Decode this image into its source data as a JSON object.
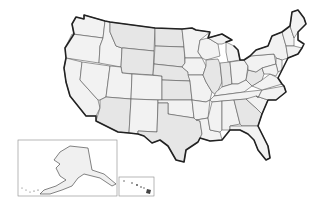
{
  "map": {
    "title": "",
    "subject": "Blank outline map of the United States",
    "features": {
      "contiguous_states": "48 state outlines with internal borders, no labels",
      "insets": [
        {
          "name": "alaska-inset",
          "description": "Alaska in a framed inset at lower left"
        },
        {
          "name": "hawaii-inset",
          "description": "Hawaiian Islands in a small framed inset right of Alaska"
        }
      ],
      "labels": []
    },
    "colors": {
      "land_fill": "#f2f2f2",
      "land_shade": "#e6e6e6",
      "state_border": "#555555",
      "national_border": "#222222",
      "background": "#ffffff"
    }
  }
}
